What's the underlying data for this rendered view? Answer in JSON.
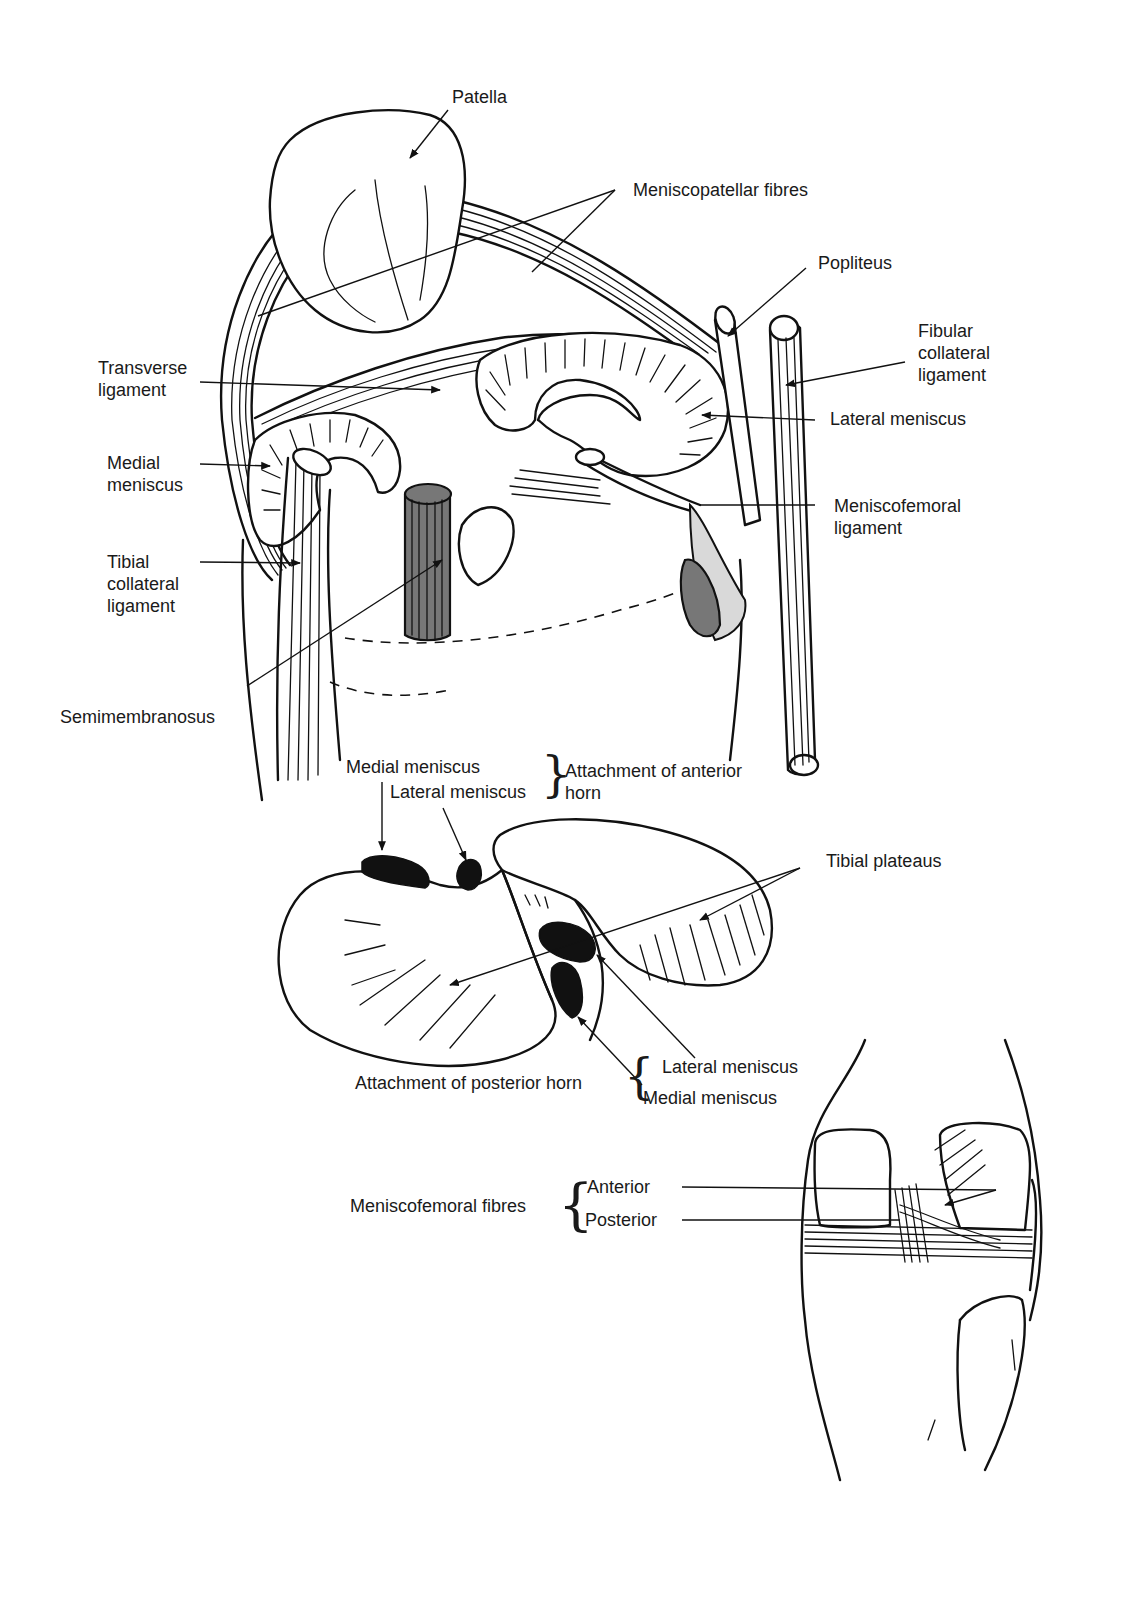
{
  "figure": {
    "top_panel": {
      "title": "Knee menisci and ligaments (superior view)",
      "labels": {
        "patella": "Patella",
        "meniscopatellar_fibres": "Meniscopatellar fibres",
        "popliteus": "Popliteus",
        "fibular_collateral_ligament": [
          "Fibular",
          "collateral",
          "ligament"
        ],
        "transverse_ligament": [
          "Transverse",
          "ligament"
        ],
        "lateral_meniscus": "Lateral meniscus",
        "medial_meniscus": [
          "Medial",
          "meniscus"
        ],
        "meniscofemoral_ligament": [
          "Meniscofemoral",
          "ligament"
        ],
        "tibial_collateral_ligament": [
          "Tibial",
          "collateral",
          "ligament"
        ],
        "semimembranosus": "Semimembranosus"
      }
    },
    "middle_panel": {
      "labels": {
        "anterior_medial_meniscus": "Medial meniscus",
        "anterior_lateral_meniscus": "Lateral meniscus",
        "attachment_anterior_horn": [
          "Attachment of anterior",
          "horn"
        ],
        "tibial_plateaus": "Tibial plateaus",
        "posterior_lateral_meniscus": "Lateral meniscus",
        "posterior_medial_meniscus": "Medial meniscus",
        "attachment_posterior_horn": "Attachment of posterior horn"
      }
    },
    "bottom_panel": {
      "labels": {
        "meniscofemoral_fibres": "Meniscofemoral fibres",
        "anterior": "Anterior",
        "posterior": "Posterior"
      }
    },
    "colors": {
      "ink": "#111111",
      "shade_dark": "#777777",
      "shade_light": "#d9d9d9",
      "background": "#ffffff"
    }
  }
}
